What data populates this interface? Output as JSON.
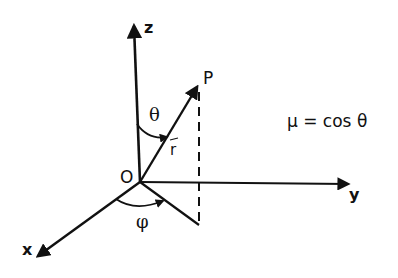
{
  "diagram": {
    "labels": {
      "z_axis": "z",
      "y_axis": "y",
      "x_axis": "x",
      "origin": "O",
      "point": "P",
      "vector": "r",
      "polar_angle": "θ",
      "azimuth_angle": "φ"
    },
    "equation": "μ = cos θ",
    "colors": {
      "ink": "#111111",
      "background": "#ffffff"
    }
  }
}
